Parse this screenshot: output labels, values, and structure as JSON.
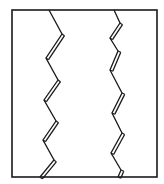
{
  "diagram": {
    "canvas": {
      "width": 164,
      "height": 184,
      "background": "#ffffff"
    },
    "stroke_color": "#1a1a1a",
    "frame": {
      "x": 12,
      "y": 10,
      "width": 145,
      "height": 167,
      "stroke_width": 1.6
    },
    "zigzags": [
      {
        "name": "left-zigzag",
        "stroke_width": 1.3,
        "points": [
          [
            49,
            10
          ],
          [
            62,
            34
          ],
          [
            46,
            58
          ],
          [
            58,
            80
          ],
          [
            44,
            100
          ],
          [
            56,
            121
          ],
          [
            43,
            140
          ],
          [
            54,
            160
          ],
          [
            40,
            177
          ]
        ],
        "doubled_segments": [
          1,
          3,
          5,
          7
        ],
        "double_offset": 3
      },
      {
        "name": "right-zigzag",
        "stroke_width": 1.3,
        "points": [
          [
            114,
            10
          ],
          [
            120,
            23
          ],
          [
            110,
            38
          ],
          [
            118,
            51
          ],
          [
            110,
            70
          ],
          [
            122,
            93
          ],
          [
            112,
            113
          ],
          [
            122,
            133
          ],
          [
            111,
            153
          ],
          [
            121,
            170
          ],
          [
            118,
            177
          ]
        ],
        "doubled_segments": [
          1,
          3,
          5,
          7,
          9
        ],
        "double_offset": 3
      }
    ]
  }
}
